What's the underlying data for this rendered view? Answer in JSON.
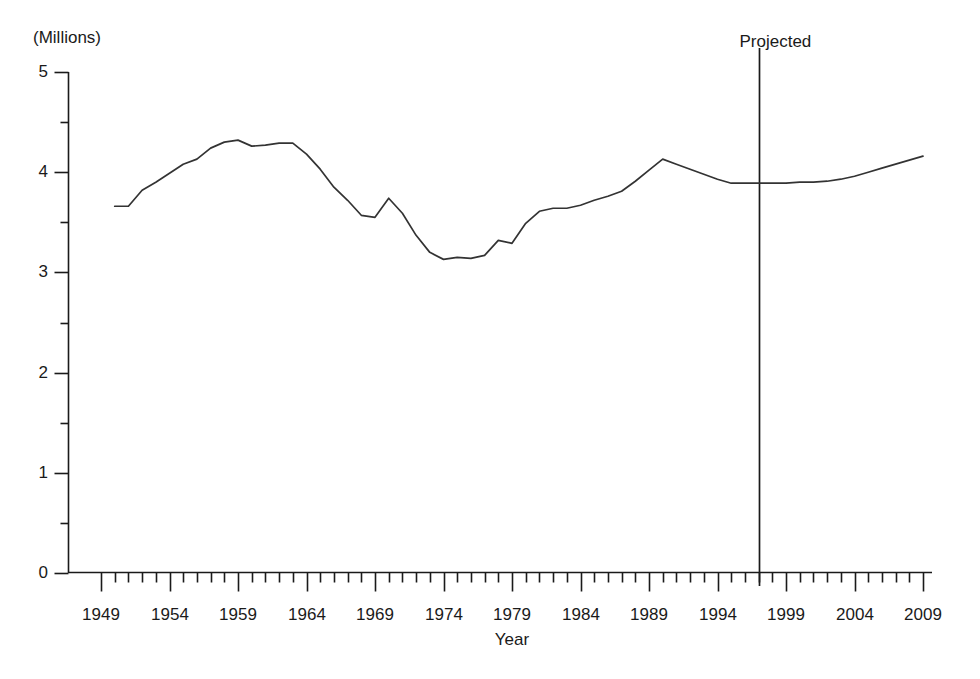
{
  "chart_data": {
    "type": "line",
    "title": "",
    "unit_note": "(Millions)",
    "xlabel": "Year",
    "ylabel": "",
    "ylim": [
      0,
      5
    ],
    "xlim": [
      1949,
      2009
    ],
    "grid": false,
    "legend": null,
    "y_ticks_major": [
      0,
      1,
      2,
      3,
      4,
      5
    ],
    "y_ticks_minor": [
      0.5,
      1.5,
      2.5,
      3.5,
      4.5
    ],
    "x_ticks_major": [
      1949,
      1954,
      1959,
      1964,
      1969,
      1974,
      1979,
      1984,
      1989,
      1994,
      1999,
      2004,
      2009
    ],
    "x_tick_interval_minor": 1,
    "annotations": [
      {
        "text": "Projected",
        "x": 1997,
        "type": "vertical-divider"
      }
    ],
    "series": [
      {
        "name": "value",
        "x": [
          1950,
          1951,
          1952,
          1953,
          1954,
          1955,
          1956,
          1957,
          1958,
          1959,
          1960,
          1961,
          1962,
          1963,
          1964,
          1965,
          1966,
          1967,
          1968,
          1969,
          1970,
          1971,
          1972,
          1973,
          1974,
          1975,
          1976,
          1977,
          1978,
          1979,
          1980,
          1981,
          1982,
          1983,
          1984,
          1985,
          1986,
          1987,
          1988,
          1989,
          1990,
          1991,
          1992,
          1993,
          1994,
          1995,
          1996,
          1997,
          1998,
          1999,
          2000,
          2001,
          2002,
          2003,
          2004,
          2005,
          2006,
          2007,
          2008,
          2009
        ],
        "values": [
          3.66,
          3.66,
          3.82,
          3.9,
          3.99,
          4.08,
          4.13,
          4.24,
          4.3,
          4.32,
          4.26,
          4.27,
          4.29,
          4.29,
          4.18,
          4.03,
          3.85,
          3.72,
          3.57,
          3.55,
          3.74,
          3.59,
          3.37,
          3.2,
          3.13,
          3.15,
          3.14,
          3.17,
          3.32,
          3.29,
          3.49,
          3.61,
          3.64,
          3.64,
          3.67,
          3.72,
          3.76,
          3.81,
          3.91,
          4.02,
          4.13,
          4.08,
          4.03,
          3.98,
          3.93,
          3.89,
          3.89,
          3.89,
          3.89,
          3.89,
          3.9,
          3.9,
          3.91,
          3.93,
          3.96,
          4.0,
          4.04,
          4.08,
          4.12,
          4.16
        ]
      }
    ]
  },
  "labels": {
    "unit": "(Millions)",
    "projected": "Projected",
    "x_axis_title": "Year",
    "y_tick_0": "0",
    "y_tick_1": "1",
    "y_tick_2": "2",
    "y_tick_3": "3",
    "y_tick_4": "4",
    "y_tick_5": "5",
    "x_tick_1949": "1949",
    "x_tick_1954": "1954",
    "x_tick_1959": "1959",
    "x_tick_1964": "1964",
    "x_tick_1969": "1969",
    "x_tick_1974": "1974",
    "x_tick_1979": "1979",
    "x_tick_1984": "1984",
    "x_tick_1989": "1989",
    "x_tick_1994": "1994",
    "x_tick_1999": "1999",
    "x_tick_2004": "2004",
    "x_tick_2009": "2009"
  },
  "colors": {
    "line": "#333333",
    "axis": "#1a1a1a",
    "background": "#ffffff",
    "text": "#1a1a1a"
  }
}
